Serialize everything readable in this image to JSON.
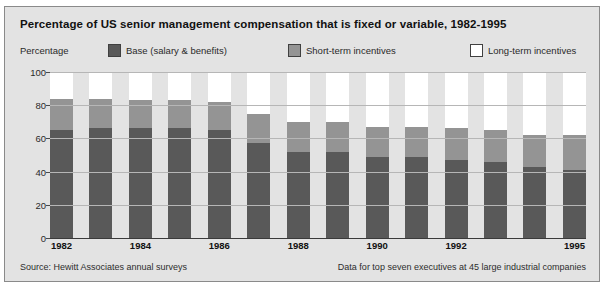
{
  "title": "Percentage of US senior management compensation that is fixed or variable, 1982-1995",
  "axis_caption": "Percentage",
  "legend": [
    {
      "label": "Base (salary & benefits)",
      "color": "#595959",
      "icon": "legend-swatch-icon"
    },
    {
      "label": "Short-term incentives",
      "color": "#949494",
      "icon": "legend-swatch-icon"
    },
    {
      "label": "Long-term incentives",
      "color": "#ffffff",
      "icon": "legend-swatch-icon"
    }
  ],
  "footer": {
    "source": "Source: Hewitt Associates annual surveys",
    "note": "Data for top seven executives at 45 large industrial companies"
  },
  "colors": {
    "base": "#595959",
    "short_term": "#949494",
    "long_term": "#ffffff",
    "panel_background": "#e3e3e3",
    "gridline": "#b6b6b6",
    "axis": "#3a3a3a"
  },
  "chart_data": {
    "type": "bar",
    "stacked": true,
    "title": "Percentage of US senior management compensation that is fixed or variable, 1982-1995",
    "xlabel": "",
    "ylabel": "Percentage",
    "ylim": [
      0,
      100
    ],
    "yticks": [
      0,
      20,
      40,
      60,
      80,
      100
    ],
    "grid": true,
    "legend_position": "top",
    "categories": [
      "1982",
      "1983",
      "1984",
      "1985",
      "1986",
      "1987",
      "1988",
      "1989",
      "1990",
      "1991",
      "1992",
      "1993",
      "1994",
      "1995"
    ],
    "visible_xtick_labels": [
      "1982",
      "1984",
      "1986",
      "1988",
      "1990",
      "1992",
      "1995"
    ],
    "series": [
      {
        "name": "Base (salary & benefits)",
        "color": "#595959",
        "values": [
          65,
          66,
          66,
          66,
          65,
          57,
          52,
          52,
          49,
          49,
          47,
          46,
          43,
          41
        ]
      },
      {
        "name": "Short-term incentives",
        "color": "#949494",
        "values": [
          19,
          18,
          17,
          17,
          17,
          18,
          18,
          18,
          18,
          18,
          19,
          19,
          19,
          21
        ]
      },
      {
        "name": "Long-term incentives",
        "color": "#ffffff",
        "values": [
          16,
          16,
          17,
          17,
          18,
          25,
          30,
          30,
          33,
          33,
          34,
          35,
          38,
          38
        ]
      }
    ],
    "cumulative_tops": {
      "base": [
        65,
        66,
        66,
        66,
        65,
        57,
        52,
        52,
        49,
        49,
        47,
        46,
        43,
        41
      ],
      "base_plus_short": [
        84,
        84,
        83,
        83,
        82,
        75,
        70,
        70,
        67,
        67,
        66,
        65,
        62,
        62
      ]
    }
  }
}
